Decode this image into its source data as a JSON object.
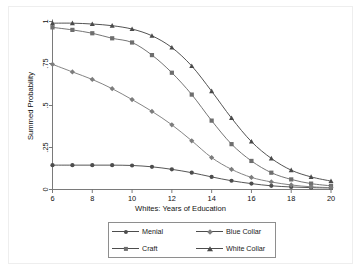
{
  "chart_data": {
    "type": "line",
    "title": "",
    "subtitle": "",
    "xlabel": "Whites: Years of Education",
    "ylabel": "Summed Probability",
    "xlim": [
      6,
      20
    ],
    "ylim": [
      0,
      1
    ],
    "grid": false,
    "legend_position": "bottom",
    "xticks": [
      "6",
      "8",
      "10",
      "12",
      "14",
      "16",
      "18",
      "20"
    ],
    "xtick_values": [
      6,
      8,
      10,
      12,
      14,
      16,
      18,
      20
    ],
    "yticks": [
      "0",
      ".25",
      ".5",
      ".75",
      "1"
    ],
    "ytick_values": [
      0,
      0.25,
      0.5,
      0.75,
      1
    ],
    "x": [
      6,
      7,
      8,
      9,
      10,
      11,
      12,
      13,
      14,
      15,
      16,
      17,
      18,
      19,
      20
    ],
    "series": [
      {
        "name": "Menial",
        "marker": "circle",
        "color": "#4d4d4d",
        "values": [
          0.145,
          0.145,
          0.145,
          0.145,
          0.143,
          0.135,
          0.12,
          0.1,
          0.075,
          0.052,
          0.035,
          0.022,
          0.015,
          0.011,
          0.009
        ]
      },
      {
        "name": "Craft",
        "marker": "square",
        "color": "#6e6e6e",
        "values": [
          0.965,
          0.95,
          0.93,
          0.9,
          0.875,
          0.8,
          0.695,
          0.565,
          0.41,
          0.27,
          0.17,
          0.1,
          0.06,
          0.035,
          0.022
        ]
      },
      {
        "name": "Blue Collar",
        "marker": "diamond",
        "color": "#7d7d7d",
        "values": [
          0.745,
          0.7,
          0.655,
          0.6,
          0.535,
          0.465,
          0.385,
          0.29,
          0.19,
          0.12,
          0.072,
          0.045,
          0.027,
          0.016,
          0.011
        ]
      },
      {
        "name": "White Collar",
        "marker": "triangle",
        "color": "#4a4a4a",
        "values": [
          0.99,
          0.99,
          0.985,
          0.975,
          0.955,
          0.915,
          0.845,
          0.735,
          0.585,
          0.425,
          0.285,
          0.185,
          0.115,
          0.075,
          0.05
        ]
      }
    ]
  },
  "legend": {
    "entries": [
      {
        "label": "Menial"
      },
      {
        "label": "Blue Collar"
      },
      {
        "label": "Craft"
      },
      {
        "label": "White Collar"
      }
    ]
  }
}
